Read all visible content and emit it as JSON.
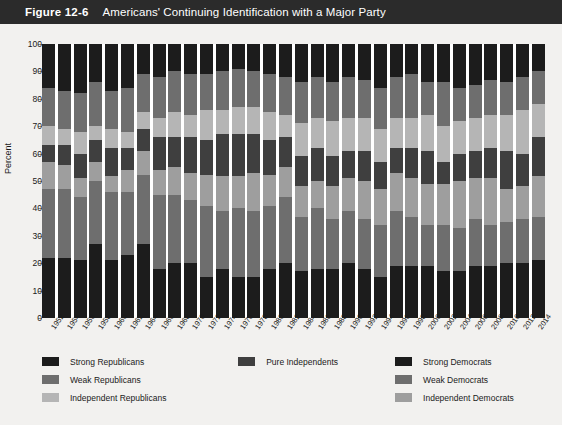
{
  "header": {
    "figure_number": "Figure 12-6",
    "title": "Americans' Continuing Identification with a Major Party"
  },
  "axis": {
    "ylabel": "Percent",
    "yticks": [
      "0",
      "10",
      "20",
      "30",
      "40",
      "50",
      "60",
      "70",
      "80",
      "90",
      "100"
    ]
  },
  "legend": {
    "columns": [
      [
        {
          "label": "Strong Republicans",
          "color": "#1c1c1c"
        },
        {
          "label": "Weak Republicans",
          "color": "#6e6e6e"
        },
        {
          "label": "Independent Republicans",
          "color": "#b5b5b5"
        }
      ],
      [
        {
          "label": "Pure Independents",
          "color": "#3f3f3f"
        }
      ],
      [
        {
          "label": "Strong Democrats",
          "color": "#1c1c1c"
        },
        {
          "label": "Weak Democrats",
          "color": "#6e6e6e"
        },
        {
          "label": "Independent Democrats",
          "color": "#9e9e9e"
        }
      ]
    ]
  },
  "chart_data": {
    "type": "bar",
    "stacked": true,
    "normalized": true,
    "title": "Americans' Continuing Identification with a Major Party",
    "xlabel": "",
    "ylabel": "Percent",
    "ylim": [
      0,
      100
    ],
    "ytick_step": 10,
    "grid": false,
    "legend_position": "bottom",
    "categories": [
      "1952",
      "1954",
      "1956",
      "1958",
      "1960",
      "1962",
      "1964",
      "1966",
      "1968",
      "1970",
      "1972",
      "1974",
      "1976",
      "1978",
      "1980",
      "1982",
      "1984",
      "1986",
      "1988",
      "1990",
      "1992",
      "1994",
      "1996",
      "1998",
      "2000",
      "2002",
      "2004",
      "2006",
      "2008",
      "2010",
      "2012",
      "2014"
    ],
    "series": [
      {
        "name": "Strong Democrats",
        "color": "#1c1c1c",
        "values": [
          22,
          22,
          21,
          27,
          21,
          23,
          27,
          18,
          20,
          20,
          15,
          18,
          15,
          15,
          18,
          20,
          17,
          18,
          18,
          20,
          18,
          15,
          19,
          19,
          19,
          17,
          17,
          19,
          19,
          20,
          20,
          21
        ]
      },
      {
        "name": "Weak Democrats",
        "color": "#6e6e6e",
        "values": [
          25,
          25,
          23,
          23,
          25,
          23,
          25,
          27,
          25,
          23,
          26,
          21,
          25,
          24,
          23,
          24,
          20,
          22,
          18,
          19,
          18,
          19,
          20,
          18,
          15,
          17,
          16,
          17,
          15,
          15,
          16,
          16
        ]
      },
      {
        "name": "Independent Democrats",
        "color": "#9e9e9e",
        "values": [
          10,
          9,
          7,
          7,
          6,
          8,
          9,
          9,
          10,
          10,
          11,
          13,
          12,
          14,
          11,
          11,
          11,
          10,
          12,
          12,
          14,
          13,
          14,
          14,
          15,
          15,
          17,
          15,
          17,
          12,
          12,
          15
        ]
      },
      {
        "name": "Pure Independents",
        "color": "#3f3f3f",
        "values": [
          6,
          7,
          9,
          8,
          10,
          8,
          8,
          12,
          11,
          13,
          13,
          15,
          15,
          14,
          13,
          11,
          11,
          12,
          11,
          10,
          11,
          10,
          9,
          11,
          12,
          8,
          10,
          10,
          11,
          14,
          12,
          14
        ]
      },
      {
        "name": "Independent Republicans",
        "color": "#b5b5b5",
        "values": [
          7,
          6,
          8,
          5,
          7,
          6,
          6,
          7,
          9,
          8,
          11,
          9,
          10,
          10,
          10,
          8,
          12,
          11,
          13,
          12,
          12,
          12,
          11,
          11,
          13,
          13,
          12,
          12,
          12,
          13,
          16,
          12
        ]
      },
      {
        "name": "Weak Republicans",
        "color": "#6e6e6e",
        "values": [
          14,
          14,
          14,
          16,
          14,
          16,
          14,
          15,
          15,
          15,
          13,
          14,
          14,
          13,
          14,
          14,
          15,
          15,
          14,
          15,
          14,
          15,
          15,
          16,
          12,
          16,
          12,
          12,
          13,
          12,
          12,
          12
        ]
      },
      {
        "name": "Strong Republicans",
        "color": "#1c1c1c",
        "values": [
          16,
          17,
          18,
          14,
          17,
          16,
          11,
          12,
          10,
          11,
          11,
          10,
          9,
          10,
          11,
          12,
          14,
          12,
          14,
          12,
          13,
          16,
          12,
          11,
          14,
          14,
          16,
          15,
          13,
          14,
          12,
          10
        ]
      }
    ],
    "stack_order_top_to_bottom": [
      "Strong Republicans",
      "Weak Republicans",
      "Independent Republicans",
      "Pure Independents",
      "Independent Democrats",
      "Weak Democrats",
      "Strong Democrats"
    ]
  }
}
